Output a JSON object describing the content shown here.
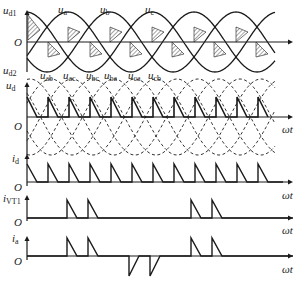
{
  "figure": {
    "panels": [
      {
        "id": "ud1_ud2",
        "ylabel_top": "u",
        "ylabel_top_sub": "d1",
        "ylabel_bottom": "u",
        "ylabel_bottom_sub": "d2",
        "origin": "O",
        "phase_labels": [
          {
            "base": "u",
            "sub": "a"
          },
          {
            "base": "u",
            "sub": "b"
          },
          {
            "base": "u",
            "sub": "c"
          }
        ]
      },
      {
        "id": "ud",
        "ylabel": "u",
        "ylabel_sub": "d",
        "origin": "O",
        "xlabel": "ωt",
        "line_labels": [
          {
            "base": "u",
            "sub": "ab"
          },
          {
            "base": "u",
            "sub": "ac"
          },
          {
            "base": "u",
            "sub": "bc"
          },
          {
            "base": "u",
            "sub": "ba"
          },
          {
            "base": "u",
            "sub": "ca"
          },
          {
            "base": "u",
            "sub": "cb"
          }
        ]
      },
      {
        "id": "id",
        "ylabel": "i",
        "ylabel_sub": "d",
        "origin": "O",
        "xlabel": "ωt"
      },
      {
        "id": "ivt1",
        "ylabel": "i",
        "ylabel_sub": "VT1",
        "origin": "O",
        "xlabel": "ωt"
      },
      {
        "id": "ia",
        "ylabel": "i",
        "ylabel_sub": "a",
        "origin": "O",
        "xlabel": "ωt"
      }
    ]
  },
  "colors": {
    "ink": "#1a1a1a",
    "background": "#ffffff"
  }
}
